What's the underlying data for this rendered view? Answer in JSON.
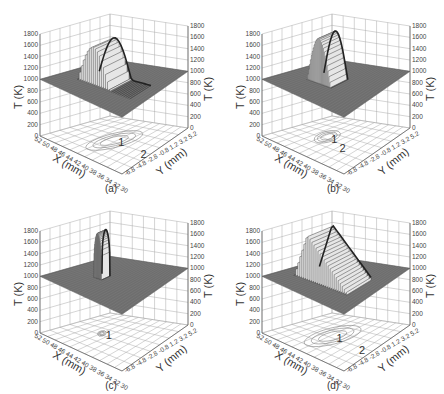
{
  "chart_data": [
    {
      "panel": "(a)",
      "type": "surface3d",
      "zlabel": "T (K)",
      "xlabel": "X (mm)",
      "ylabel": "Y (mm)",
      "z_ticks": [
        "0",
        "200",
        "400",
        "600",
        "800",
        "1000",
        "1200",
        "1400",
        "1600",
        "1800"
      ],
      "zlim": [
        0,
        1800
      ],
      "x_ticks": [
        "52",
        "50",
        "48",
        "46",
        "44",
        "42",
        "40",
        "38",
        "36",
        "34",
        "32",
        "30"
      ],
      "y_ticks": [
        "-6.8",
        "-4.8",
        "-2.8",
        "-0.8",
        "1.2",
        "3.2",
        "5.2"
      ],
      "base_temperature": 1000,
      "peak_temperature": 1700,
      "shape": "elongated molten pool, broad plateau tapering toward low X",
      "contour_labels": [
        "1",
        "2"
      ]
    },
    {
      "panel": "(b)",
      "type": "surface3d",
      "zlabel": "T (K)",
      "xlabel": "X (mm)",
      "ylabel": "Y (mm)",
      "z_ticks": [
        "0",
        "200",
        "400",
        "600",
        "800",
        "1000",
        "1200",
        "1400",
        "1600",
        "1800"
      ],
      "zlim": [
        0,
        1800
      ],
      "x_ticks": [
        "52",
        "50",
        "48",
        "46",
        "44",
        "42",
        "40",
        "38",
        "36",
        "34",
        "32",
        "30"
      ],
      "y_ticks": [
        "-6.8",
        "-4.8",
        "-2.8",
        "-0.8",
        "1.2",
        "3.2",
        "5.2"
      ],
      "base_temperature": 1000,
      "peak_temperature": 1800,
      "shape": "compact rounded peak",
      "contour_labels": [
        "1",
        "2"
      ]
    },
    {
      "panel": "(c)",
      "type": "surface3d",
      "zlabel": "T (K)",
      "xlabel": "X (mm)",
      "ylabel": "Y (mm)",
      "z_ticks": [
        "0",
        "200",
        "400",
        "600",
        "800",
        "1000",
        "1200",
        "1400",
        "1600",
        "1800"
      ],
      "zlim": [
        0,
        1800
      ],
      "x_ticks": [
        "52",
        "50",
        "48",
        "46",
        "44",
        "42",
        "40",
        "38",
        "36",
        "34",
        "32",
        "30"
      ],
      "y_ticks": [
        "-6.8",
        "-4.8",
        "-2.8",
        "-0.8",
        "1.2",
        "3.2",
        "5.2"
      ],
      "base_temperature": 1000,
      "peak_temperature": 1800,
      "shape": "narrow column",
      "contour_labels": [
        "1"
      ]
    },
    {
      "panel": "(d)",
      "type": "surface3d",
      "zlabel": "T (K)",
      "xlabel": "X (mm)",
      "ylabel": "Y (mm)",
      "z_ticks": [
        "0",
        "200",
        "400",
        "600",
        "800",
        "1000",
        "1200",
        "1400",
        "1600",
        "1800"
      ],
      "zlim": [
        0,
        1800
      ],
      "x_ticks": [
        "52",
        "50",
        "48",
        "46",
        "44",
        "42",
        "40",
        "38",
        "36",
        "34",
        "32",
        "30"
      ],
      "y_ticks": [
        "-6.8",
        "-4.8",
        "-2.8",
        "-0.8",
        "1.2",
        "3.2",
        "5.2"
      ],
      "base_temperature": 1000,
      "peak_temperature": 1800,
      "shape": "large peaked pool with long tail",
      "contour_labels": [
        "1",
        "2"
      ]
    }
  ],
  "panels": [
    {
      "caption": "(a)",
      "zlabel": "T (K)",
      "xlabel": "X (mm)",
      "ylabel": "Y (mm)",
      "c1": "1",
      "c2": "2"
    },
    {
      "caption": "(b)",
      "zlabel": "T (K)",
      "xlabel": "X (mm)",
      "ylabel": "Y (mm)",
      "c1": "1",
      "c2": "2"
    },
    {
      "caption": "(c)",
      "zlabel": "T (K)",
      "xlabel": "X (mm)",
      "ylabel": "Y (mm)",
      "c1": "1",
      "c2": ""
    },
    {
      "caption": "(d)",
      "zlabel": "T (K)",
      "xlabel": "X (mm)",
      "ylabel": "Y (mm)",
      "c1": "1",
      "c2": "2"
    }
  ],
  "z_ticks": [
    "0",
    "200",
    "400",
    "600",
    "800",
    "1000",
    "1200",
    "1400",
    "1600",
    "1800"
  ],
  "x_tick_text": "52 50 48 46 44 42 40 38 36 34 32 30",
  "y_tick_text": "-6.8 -4.8 -2.8 -0.8 1.2 3.2 5.2"
}
